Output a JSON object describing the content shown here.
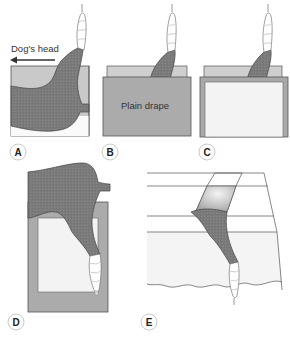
{
  "figure": {
    "panels": [
      {
        "id": "A",
        "label": "A",
        "annotation": "Dog's head",
        "arrow_direction": "left"
      },
      {
        "id": "B",
        "label": "B",
        "annotation": "Plain drape"
      },
      {
        "id": "C",
        "label": "C"
      },
      {
        "id": "D",
        "label": "D"
      },
      {
        "id": "E",
        "label": "E"
      }
    ]
  },
  "colors": {
    "limb": "#7d7d7d",
    "limb_dark": "#6a6a6a",
    "drape": "#a9a9a9",
    "drape_light": "#c8c8c8",
    "window": "#f2f2f2",
    "table_fill": "#f4f4f4",
    "line": "#555555",
    "bandage": "#ffffff",
    "label_circle": "#bbbbbb"
  }
}
